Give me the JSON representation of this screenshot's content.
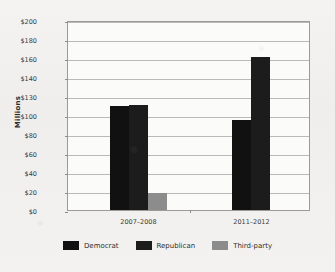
{
  "chart_data": {
    "type": "bar",
    "title": "",
    "xlabel": "",
    "ylabel": "Millions",
    "categories": [
      "2007–2008",
      "2011–2012"
    ],
    "series": [
      {
        "name": "Democrat",
        "color": "#111111",
        "values": [
          110,
          95
        ]
      },
      {
        "name": "Republican",
        "color": "#1c1c1c",
        "values": [
          111,
          161
        ]
      },
      {
        "name": "Third-party",
        "color": "#8c8c8c",
        "values": [
          18,
          0
        ]
      }
    ],
    "ylim": [
      0,
      200
    ],
    "yticks": [
      0,
      20,
      40,
      60,
      80,
      100,
      130,
      140,
      160,
      180,
      200
    ],
    "ytick_labels": [
      "$0",
      "$20",
      "$40",
      "$60",
      "$80",
      "$100",
      "$130",
      "$140",
      "$160",
      "$180",
      "$200"
    ],
    "grid": true,
    "legend_position": "bottom"
  },
  "legend": {
    "items": [
      {
        "label": "Democrat"
      },
      {
        "label": "Republican"
      },
      {
        "label": "Third-party"
      }
    ]
  }
}
